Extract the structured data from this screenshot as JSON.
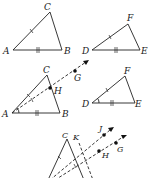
{
  "diagram": {
    "figure1": {
      "triangle_abc": {
        "labels": {
          "A": "A",
          "B": "B",
          "C": "C"
        },
        "points": {
          "A": [
            13,
            50
          ],
          "B": [
            62,
            50
          ],
          "C": [
            50,
            12
          ]
        }
      },
      "triangle_def": {
        "labels": {
          "D": "D",
          "E": "E",
          "F": "F"
        },
        "points": {
          "D": [
            92,
            50
          ],
          "E": [
            140,
            50
          ],
          "F": [
            128,
            24
          ]
        }
      },
      "marks": {
        "AC_DF": "single tick",
        "AB_DE": "double tick"
      }
    },
    "figure2": {
      "triangle_abc": {
        "labels": {
          "A": "A",
          "B": "B",
          "C": "C",
          "H": "H",
          "G": "G"
        },
        "points": {
          "A": [
            12,
            113
          ],
          "B": [
            60,
            113
          ],
          "C": [
            47,
            75
          ],
          "H": [
            50,
            88
          ],
          "G": [
            75,
            71
          ]
        }
      },
      "triangle_def": {
        "labels": {
          "D": "D",
          "E": "E",
          "F": "F"
        },
        "points": {
          "D": [
            92,
            103
          ],
          "E": [
            135,
            103
          ],
          "F": [
            125,
            76
          ]
        }
      },
      "marks": {
        "angle_A_D": "single arc",
        "AC_DF": "single tick",
        "AB_DE": "double tick",
        "AH": "single tick"
      }
    },
    "figure3": {
      "labels": {
        "C": "C",
        "K": "K",
        "J": "J",
        "G": "G",
        "H": "H"
      },
      "points": {
        "C": [
          67,
          139
        ],
        "K": [
          79,
          143
        ],
        "J": [
          104,
          135
        ],
        "G": [
          116,
          143
        ],
        "H": [
          99,
          151
        ]
      }
    }
  }
}
